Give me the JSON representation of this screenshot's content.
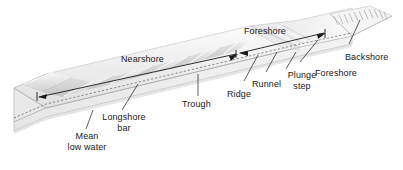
{
  "figure": {
    "type": "block-diagram",
    "background_color": "#ffffff",
    "ink_color": "#1a1a1a",
    "surface_light": "#f2f2f2",
    "surface_mid": "#dcdcdc",
    "surface_dark": "#c8c8c8",
    "side_face": "#ededed",
    "end_face": "#e4e4e4"
  },
  "dimension_arrows": [
    {
      "id": "nearshore",
      "label": "Nearshore",
      "style": "double-ended",
      "span_from": "mean low water / seaward limit",
      "span_to": "foreshore boundary"
    },
    {
      "id": "foreshore-extent",
      "label": "Foreshore",
      "style": "double-ended",
      "span_from": "plunge step",
      "span_to": "backshore boundary"
    }
  ],
  "leader_labels": [
    {
      "id": "backshore",
      "label": "Backshore"
    },
    {
      "id": "foreshore",
      "label": "Foreshore"
    },
    {
      "id": "plunge-step",
      "line1": "Plunge",
      "line2": "step"
    },
    {
      "id": "runnel",
      "label": "Runnel"
    },
    {
      "id": "ridge",
      "label": "Ridge"
    },
    {
      "id": "trough",
      "label": "Trough"
    },
    {
      "id": "longshore-bar",
      "line1": "Longshore",
      "line2": "bar"
    },
    {
      "id": "mean-low-water",
      "line1": "Mean",
      "line2": "low water"
    }
  ]
}
